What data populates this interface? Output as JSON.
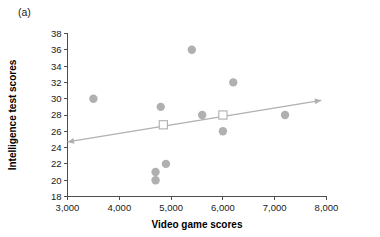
{
  "figure": {
    "panel_label": "(a)"
  },
  "chart_data": {
    "type": "scatter",
    "title": "",
    "panel": "(a)",
    "xlabel": "Video game scores",
    "ylabel": "Intelligence test scores",
    "xlim": [
      3000,
      8000
    ],
    "ylim": [
      18,
      38
    ],
    "xticks": [
      3000,
      4000,
      5000,
      6000,
      7000,
      8000
    ],
    "xticklabels": [
      "3,000",
      "4,000",
      "5,000",
      "6,000",
      "7,000",
      "8,000"
    ],
    "yticks": [
      18,
      20,
      22,
      24,
      26,
      28,
      30,
      32,
      34,
      36,
      38
    ],
    "yticklabels": [
      "18",
      "20",
      "22",
      "24",
      "26",
      "28",
      "30",
      "32",
      "34",
      "36",
      "38"
    ],
    "grid": false,
    "legend": "none",
    "marker_color": "#b0b0b0",
    "line_color": "#b0b0b0",
    "series": [
      {
        "name": "observations",
        "marker": "circle",
        "points": [
          {
            "x": 3500,
            "y": 30
          },
          {
            "x": 4700,
            "y": 21
          },
          {
            "x": 4700,
            "y": 20
          },
          {
            "x": 4800,
            "y": 29
          },
          {
            "x": 4900,
            "y": 22
          },
          {
            "x": 5400,
            "y": 36
          },
          {
            "x": 5600,
            "y": 28
          },
          {
            "x": 6000,
            "y": 26
          },
          {
            "x": 6200,
            "y": 32
          },
          {
            "x": 7200,
            "y": 28
          }
        ]
      },
      {
        "name": "highlighted-means",
        "marker": "open-square",
        "points": [
          {
            "x": 4850,
            "y": 26.8
          },
          {
            "x": 6000,
            "y": 28.0
          }
        ]
      }
    ],
    "trendline": {
      "type": "double-arrow-line",
      "x_start": 3000,
      "y_start": 24.7,
      "x_end": 7900,
      "y_end": 29.8
    }
  }
}
